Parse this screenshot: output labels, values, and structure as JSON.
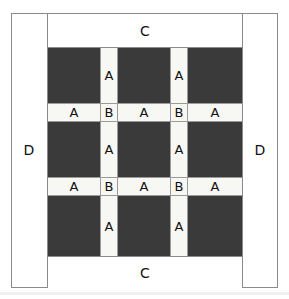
{
  "diagram": {
    "colors": {
      "dark_block": "#3a3a3a",
      "light_strip": "#f7f7f4",
      "background": "#ffffff",
      "border": "#8a8a8a",
      "text": "#111111"
    },
    "side_columns": {
      "left_label": "D",
      "right_label": "D"
    },
    "end_bands": {
      "top_label": "C",
      "bottom_label": "C"
    },
    "vertical_strips": [
      {
        "label": "A",
        "row": 1,
        "column": 1
      },
      {
        "label": "A",
        "row": 1,
        "column": 2
      },
      {
        "label": "A",
        "row": 2,
        "column": 1
      },
      {
        "label": "A",
        "row": 2,
        "column": 2
      },
      {
        "label": "A",
        "row": 3,
        "column": 1
      },
      {
        "label": "A",
        "row": 3,
        "column": 2
      }
    ],
    "horizontal_bands": [
      {
        "index": 1,
        "segments": [
          {
            "label": "A"
          },
          {
            "label": "B"
          },
          {
            "label": "A"
          },
          {
            "label": "B"
          },
          {
            "label": "A"
          }
        ]
      },
      {
        "index": 2,
        "segments": [
          {
            "label": "A"
          },
          {
            "label": "B"
          },
          {
            "label": "A"
          },
          {
            "label": "B"
          },
          {
            "label": "A"
          }
        ]
      }
    ]
  }
}
